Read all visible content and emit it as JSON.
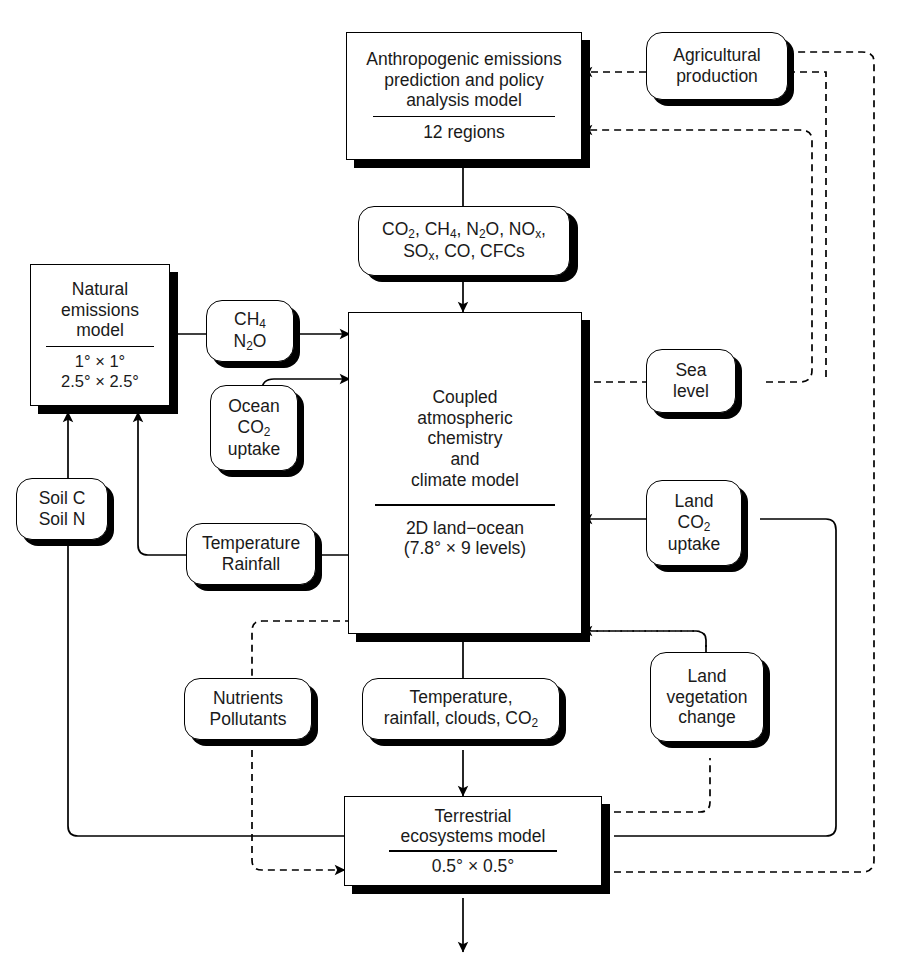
{
  "diagram": {
    "nodes": {
      "anthropogenic": {
        "line1": "Anthropogenic emissions",
        "line2": "prediction and policy",
        "line3": "analysis model",
        "sub": "12 regions",
        "shape": "rect"
      },
      "agricultural": {
        "line1": "Agricultural",
        "line2": "production",
        "shape": "round"
      },
      "emissions_species": {
        "line1_parts": [
          "CO",
          "2",
          ", CH",
          "4",
          ", N",
          "2",
          "O, NO",
          "x",
          ","
        ],
        "line1_plain": "CO2, CH4, N2O, NOx,",
        "line2_plain": "SOx, CO, CFCs",
        "shape": "round"
      },
      "natural_emissions": {
        "line1": "Natural",
        "line2": "emissions",
        "line3": "model",
        "sub1": "1° × 1°",
        "sub2": "2.5° × 2.5°",
        "shape": "rect"
      },
      "ch4_n2o": {
        "line1_plain": "CH4",
        "line2_plain": "N2O",
        "shape": "round"
      },
      "ocean_co2": {
        "line1": "Ocean",
        "line2_plain": "CO2",
        "line3": "uptake",
        "shape": "round"
      },
      "soil": {
        "line1": "Soil C",
        "line2": "Soil N",
        "shape": "round"
      },
      "temp_rainfall": {
        "line1": "Temperature",
        "line2": "Rainfall",
        "shape": "round"
      },
      "climate_model": {
        "line1": "Coupled",
        "line2": "atmospheric",
        "line3": "chemistry",
        "line4": "and",
        "line5": "climate model",
        "sub1": "2D land−ocean",
        "sub2": "(7.8° × 9 levels)",
        "shape": "rect"
      },
      "sea_level": {
        "line1": "Sea",
        "line2": "level",
        "shape": "round"
      },
      "land_co2": {
        "line1": "Land",
        "line2_plain": "CO2",
        "line3": "uptake",
        "shape": "round"
      },
      "nutrients": {
        "line1": "Nutrients",
        "line2": "Pollutants",
        "shape": "round"
      },
      "climate_outputs": {
        "line1": "Temperature,",
        "line2_plain": "rainfall, clouds, CO2",
        "shape": "round"
      },
      "land_vegetation": {
        "line1": "Land",
        "line2": "vegetation",
        "line3": "change",
        "shape": "round"
      },
      "terrestrial": {
        "line1": "Terrestrial",
        "line2": "ecosystems model",
        "sub": "0.5° × 0.5°",
        "shape": "rect"
      }
    },
    "colors": {
      "stroke": "#000000",
      "background": "#ffffff",
      "shadow": "#000000"
    },
    "edges": [
      {
        "from": "agricultural",
        "to": "anthropogenic",
        "style": "dashed",
        "arrow": true
      },
      {
        "from": "sea_level",
        "to": "anthropogenic",
        "style": "dashed",
        "arrow": true
      },
      {
        "from": "anthropogenic",
        "to": "emissions_species",
        "style": "solid",
        "arrow": false
      },
      {
        "from": "emissions_species",
        "to": "climate_model",
        "style": "solid",
        "arrow": true
      },
      {
        "from": "natural_emissions",
        "to": "ch4_n2o",
        "style": "solid",
        "arrow": false
      },
      {
        "from": "ch4_n2o",
        "to": "climate_model",
        "style": "solid",
        "arrow": true
      },
      {
        "from": "ocean_co2",
        "to": "climate_model",
        "style": "solid",
        "arrow": true
      },
      {
        "from": "temp_rainfall",
        "to": "climate_model",
        "style": "solid",
        "arrow": false
      },
      {
        "from": "temp_rainfall",
        "to": "natural_emissions",
        "style": "solid",
        "arrow": true
      },
      {
        "from": "soil",
        "to": "natural_emissions",
        "style": "solid",
        "arrow": true
      },
      {
        "from": "terrestrial",
        "to": "soil",
        "style": "solid",
        "arrow": false
      },
      {
        "from": "climate_model",
        "to": "sea_level",
        "style": "dashed",
        "arrow": true
      },
      {
        "from": "land_co2",
        "to": "climate_model",
        "style": "solid",
        "arrow": true
      },
      {
        "from": "land_vegetation",
        "to": "climate_model",
        "style": "dashed",
        "arrow": true
      },
      {
        "from": "climate_model",
        "to": "climate_outputs",
        "style": "solid",
        "arrow": false
      },
      {
        "from": "climate_outputs",
        "to": "terrestrial",
        "style": "solid",
        "arrow": true
      },
      {
        "from": "climate_model",
        "to": "nutrients",
        "style": "dashed",
        "arrow": false
      },
      {
        "from": "nutrients",
        "to": "terrestrial",
        "style": "dashed",
        "arrow": true
      },
      {
        "from": "terrestrial",
        "to": "land_vegetation",
        "style": "dashed",
        "arrow": false
      },
      {
        "from": "terrestrial",
        "to": "land_co2",
        "style": "solid",
        "arrow": false
      },
      {
        "from": "terrestrial",
        "to": "output",
        "style": "solid",
        "arrow": true
      }
    ]
  }
}
